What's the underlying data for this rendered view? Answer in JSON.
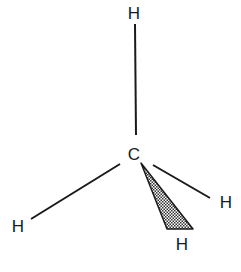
{
  "molecule": {
    "name": "methane",
    "center_atom": {
      "label": "C",
      "x": 134,
      "y": 160
    },
    "atoms": [
      {
        "id": "h-top",
        "label": "H",
        "x": 134,
        "y": 19
      },
      {
        "id": "h-left",
        "label": "H",
        "x": 18,
        "y": 232
      },
      {
        "id": "h-right",
        "label": "H",
        "x": 226,
        "y": 208
      },
      {
        "id": "h-wedge",
        "label": "H",
        "x": 182,
        "y": 250
      }
    ],
    "bonds": [
      {
        "id": "bond-top",
        "type": "single",
        "x1": 135,
        "y1": 24,
        "x2": 136,
        "y2": 135
      },
      {
        "id": "bond-left",
        "type": "single",
        "x1": 120,
        "y1": 164,
        "x2": 31,
        "y2": 219
      },
      {
        "id": "bond-right",
        "type": "single",
        "x1": 153,
        "y1": 165,
        "x2": 210,
        "y2": 198
      },
      {
        "id": "bond-wedge",
        "type": "wedge",
        "points": "141,163 167,229 193,229"
      }
    ],
    "colors": {
      "line": "#1a1a1a",
      "wedge_fill": "#7a7a7a",
      "background": "#ffffff"
    }
  }
}
